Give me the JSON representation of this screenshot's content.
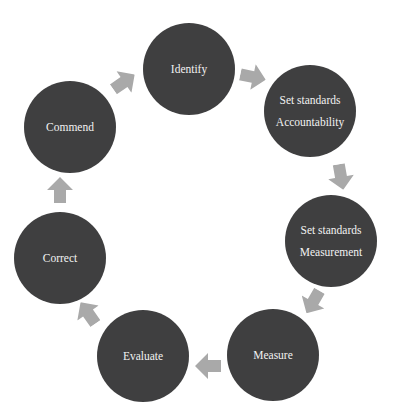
{
  "diagram": {
    "type": "cycle",
    "node_color": "#3f3f40",
    "text_color": "#f2f2f2",
    "arrow_color": "#a9a9a9",
    "nodes": [
      {
        "id": "identify",
        "lines": [
          "Identify"
        ]
      },
      {
        "id": "set-standards-accountability",
        "lines": [
          "Set standards",
          "Accountability"
        ]
      },
      {
        "id": "set-standards-measurement",
        "lines": [
          "Set standards",
          "Measurement"
        ]
      },
      {
        "id": "measure",
        "lines": [
          "Measure"
        ]
      },
      {
        "id": "evaluate",
        "lines": [
          "Evaluate"
        ]
      },
      {
        "id": "correct",
        "lines": [
          "Correct"
        ]
      },
      {
        "id": "commend",
        "lines": [
          "Commend"
        ]
      }
    ],
    "edges": [
      {
        "from": "commend",
        "to": "identify"
      },
      {
        "from": "identify",
        "to": "set-standards-accountability"
      },
      {
        "from": "set-standards-accountability",
        "to": "set-standards-measurement"
      },
      {
        "from": "set-standards-measurement",
        "to": "measure"
      },
      {
        "from": "measure",
        "to": "evaluate"
      },
      {
        "from": "evaluate",
        "to": "correct"
      },
      {
        "from": "correct",
        "to": "commend"
      }
    ]
  }
}
